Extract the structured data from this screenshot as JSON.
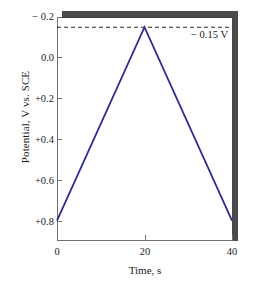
{
  "chart_data": {
    "type": "line",
    "title": "",
    "xlabel": "Time, s",
    "ylabel": "Potential, V vs. SCE",
    "xlim": [
      0,
      40
    ],
    "ylim": [
      -0.2,
      0.9
    ],
    "y_axis_inverted": true,
    "grid": false,
    "legend": "none",
    "xticks": [
      0,
      20,
      40
    ],
    "xtick_labels": [
      "0",
      "20",
      "40"
    ],
    "yticks": [
      -0.2,
      0.0,
      0.2,
      0.4,
      0.6,
      0.8
    ],
    "ytick_labels": [
      "− 0.2",
      "0.0",
      "+0.2",
      "+0.4",
      "+0.6",
      "+0.8"
    ],
    "series": [
      {
        "name": "Potential waveform",
        "color": "#2d2d8f",
        "x": [
          0,
          20,
          40
        ],
        "y": [
          0.8,
          -0.15,
          0.8
        ]
      }
    ],
    "annotations": [
      {
        "name": "switching-potential-line",
        "type": "hline",
        "value": -0.15,
        "label": "− 0.15 V",
        "style": "dashed",
        "color": "#2a2a2a"
      }
    ]
  },
  "axes": {
    "ylabel": "Potential, V vs. SCE",
    "xlabel": "Time, s",
    "ytick_labels": [
      "− 0.2",
      "0.0",
      "+0.2",
      "+0.4",
      "+0.6",
      "+0.8"
    ],
    "xtick_labels": [
      "0",
      "20",
      "40"
    ]
  },
  "annotation": {
    "label": "− 0.15 V"
  },
  "colors": {
    "trace": "#2d2d8f",
    "axis": "#707070",
    "frame_top": "#3a3a3a",
    "shadow": "#4a4a4a",
    "dashed": "#2a2a2a",
    "background": "#ffffff"
  }
}
